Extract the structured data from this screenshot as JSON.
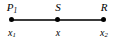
{
  "figure": {
    "type": "number-line-diagram",
    "background_color": "#ffffff",
    "line_color": "#3a3a3a",
    "dot_color": "#000000",
    "text_color": "#000000",
    "axis": {
      "start_px": 11,
      "end_px": 105,
      "y_px": 19,
      "thickness_px": 2
    },
    "points": [
      {
        "id": "point-p1",
        "x_px": 12,
        "top_label_letter": "P",
        "top_label_sub": "1",
        "bottom_label_letter": "x",
        "bottom_label_sub": "1"
      },
      {
        "id": "point-s",
        "x_px": 58,
        "top_label_letter": "S",
        "top_label_sub": "",
        "bottom_label_letter": "x",
        "bottom_label_sub": ""
      },
      {
        "id": "point-r",
        "x_px": 104,
        "top_label_letter": "R",
        "top_label_sub": "",
        "bottom_label_letter": "x",
        "bottom_label_sub": "2"
      }
    ]
  }
}
